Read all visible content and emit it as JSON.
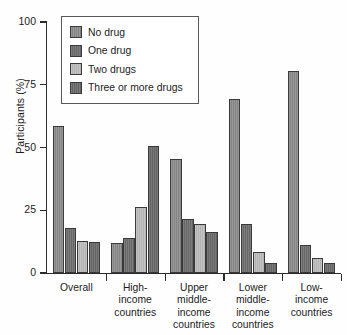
{
  "chart_data": {
    "type": "bar",
    "title": "",
    "subtitle": "",
    "xlabel": "",
    "ylabel": "Participants (%)",
    "ylim": [
      0,
      100
    ],
    "yticks": [
      0,
      25,
      50,
      75,
      100
    ],
    "ytick_labels": [
      "0",
      "25",
      "50",
      "75",
      "100"
    ],
    "grid": false,
    "legend_position": "upper-left-inside",
    "categories": [
      "Overall",
      "High-\nincome\ncountries",
      "Upper\nmiddle-\nincome\ncountries",
      "Lower\nmiddle-\nincome\ncountries",
      "Low-\nincome\ncountries"
    ],
    "series": [
      {
        "name": "No drug",
        "color": "#8c8c8c",
        "values": [
          58.5,
          12.0,
          45.5,
          69.5,
          80.5
        ]
      },
      {
        "name": "One drug",
        "color": "#6e6e6e",
        "values": [
          18.0,
          14.0,
          21.5,
          19.5,
          11.0
        ]
      },
      {
        "name": "Two drugs",
        "color": "#bdbdbd",
        "values": [
          12.8,
          26.5,
          19.5,
          8.5,
          6.0
        ]
      },
      {
        "name": "Three or more drugs",
        "color": "#6a6a6a",
        "values": [
          12.5,
          50.5,
          16.5,
          4.0,
          4.0
        ]
      }
    ]
  },
  "axes": {
    "y_title": "Participants (%)",
    "y_tick_0": "0",
    "y_tick_25": "25",
    "y_tick_50": "50",
    "y_tick_75": "75",
    "y_tick_100": "100"
  },
  "x_labels": {
    "overall": "Overall",
    "high_income": "High-\nincome\ncountries",
    "upper_middle_income": "Upper\nmiddle-\nincome\ncountries",
    "lower_middle_income": "Lower\nmiddle-\nincome\ncountries",
    "low_income": "Low-\nincome\ncountries"
  },
  "legend": {
    "items": [
      {
        "label": "No drug",
        "color": "#8c8c8c"
      },
      {
        "label": "One drug",
        "color": "#6e6e6e"
      },
      {
        "label": "Two drugs",
        "color": "#bdbdbd"
      },
      {
        "label": "Three or more drugs",
        "color": "#6a6a6a"
      }
    ]
  },
  "colors": {
    "axis": "#2b2b2b",
    "text": "#1c1c1c",
    "background": "#fefefe",
    "legend_border": "#585858",
    "bar_border": "#3a3a3a"
  }
}
